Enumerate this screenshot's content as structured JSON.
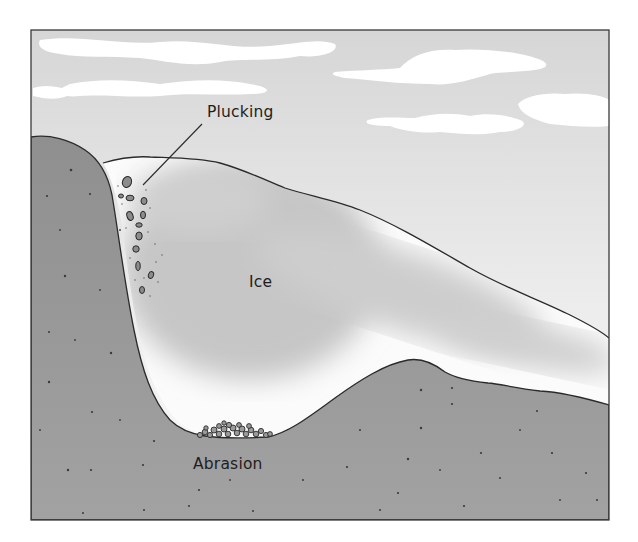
{
  "diagram": {
    "type": "cross-section",
    "labels": {
      "plucking": "Plucking",
      "ice": "Ice",
      "abrasion": "Abrasion"
    },
    "regions": [
      {
        "name": "sky",
        "description": "light gray sky with white clouds"
      },
      {
        "name": "ice",
        "description": "glacier ice filling valley, white with gray shading"
      },
      {
        "name": "bedrock",
        "description": "speckled gray bedrock forming valley walls and floor"
      }
    ],
    "features": [
      {
        "name": "plucked-rock-fragments",
        "location": "left valley wall inside ice",
        "label": "Plucking"
      },
      {
        "name": "abraded-debris-pile",
        "location": "valley floor under ice",
        "label": "Abrasion"
      }
    ],
    "colors": {
      "sky": "#dcdcdc",
      "cloud": "#ffffff",
      "ice_light": "#ffffff",
      "ice_shade": "#bdbdbd",
      "rock": "#9b9b9b",
      "rock_dark": "#8a8a8a",
      "outline": "#2a2a2a",
      "text": "#1e1e1e"
    }
  }
}
